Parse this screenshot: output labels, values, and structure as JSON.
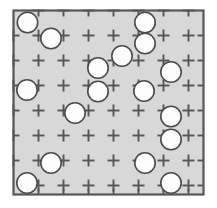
{
  "figure": {
    "type": "geometric-diagram",
    "canvas": {
      "width": 217,
      "height": 208,
      "background": "#ffffff"
    },
    "frame": {
      "name": "square-boundary",
      "x": 13.5,
      "y": 10.5,
      "width": 190,
      "height": 184,
      "fill": "#d8d8d8",
      "stroke": "#585858",
      "stroke_width": 2.2
    },
    "lattice": {
      "name": "cross-tick-grid",
      "stroke": "#555555",
      "stroke_width": 1.9,
      "arm_length": 6,
      "spacing_x": 25.0,
      "spacing_y": 25.0,
      "origin_x": 13.5,
      "origin_y": 10.5,
      "columns": 8,
      "rows": 8,
      "note": "plus-shaped tick marks at interior lattice intersections; half-crosses (stubs) along the frame edges"
    },
    "circles": {
      "name": "packed-circles",
      "count": 17,
      "radius": 10.2,
      "fill": "#fdfdfd",
      "stroke": "#4a4a4a",
      "stroke_width": 1.6,
      "items": [
        {
          "id": "c01",
          "cx": 27.5,
          "cy": 22.5
        },
        {
          "id": "c02",
          "cx": 51.0,
          "cy": 38.5
        },
        {
          "id": "c03",
          "cx": 145.0,
          "cy": 22.5
        },
        {
          "id": "c04",
          "cx": 145.0,
          "cy": 43.5
        },
        {
          "id": "c05",
          "cx": 98.0,
          "cy": 68.0
        },
        {
          "id": "c06",
          "cx": 171.0,
          "cy": 72.0
        },
        {
          "id": "c07",
          "cx": 27.0,
          "cy": 90.0
        },
        {
          "id": "c08",
          "cx": 98.0,
          "cy": 91.5
        },
        {
          "id": "c09",
          "cx": 144.0,
          "cy": 91.0
        },
        {
          "id": "c10",
          "cx": 75.0,
          "cy": 113.0
        },
        {
          "id": "c11",
          "cx": 171.0,
          "cy": 116.5
        },
        {
          "id": "c12",
          "cx": 171.0,
          "cy": 139.5
        },
        {
          "id": "c13",
          "cx": 51.0,
          "cy": 163.0
        },
        {
          "id": "c14",
          "cx": 145.0,
          "cy": 163.0
        },
        {
          "id": "c15",
          "cx": 27.0,
          "cy": 183.0
        },
        {
          "id": "c16",
          "cx": 171.0,
          "cy": 183.0
        },
        {
          "id": "c17",
          "cx": 122.0,
          "cy": 56.0
        }
      ]
    }
  }
}
